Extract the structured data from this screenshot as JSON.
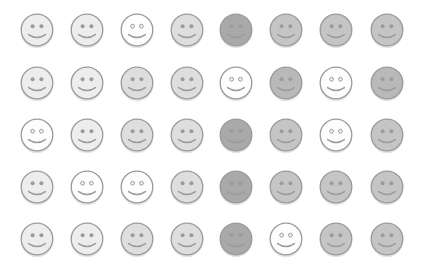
{
  "layout": {
    "columns": 8,
    "rows": 5,
    "col_centers": [
      37,
      87,
      137,
      187,
      236,
      286,
      336,
      387
    ],
    "row_centers": [
      30,
      83,
      135,
      187,
      239
    ]
  },
  "palette": {
    "white": "#fdfdfd",
    "light": "#ededed",
    "lightmid": "#dedede",
    "mid": "#c5c5c5",
    "middark": "#b9b9b9",
    "dark": "#a9a9a9",
    "outline": "#9a9a9a",
    "feature": "#9b9b9b"
  },
  "grid": [
    [
      "light",
      "light",
      "white",
      "lightmid",
      "dark",
      "mid",
      "mid",
      "mid"
    ],
    [
      "light",
      "light",
      "lightmid",
      "lightmid",
      "white",
      "middark",
      "white",
      "middark"
    ],
    [
      "white",
      "light",
      "lightmid",
      "lightmid",
      "dark",
      "mid",
      "white",
      "mid"
    ],
    [
      "light",
      "white",
      "white",
      "lightmid",
      "dark",
      "mid",
      "mid",
      "mid"
    ],
    [
      "light",
      "light",
      "lightmid",
      "lightmid",
      "dark",
      "white",
      "mid",
      "mid"
    ]
  ],
  "icon": "smiley-face-icon"
}
